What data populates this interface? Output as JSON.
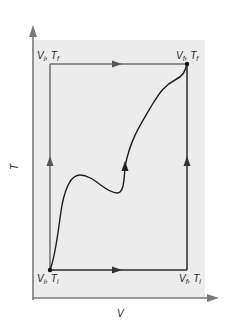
{
  "diagram": {
    "type": "thermodynamic-state-diagram",
    "axes": {
      "x_label": "V",
      "y_label": "T"
    },
    "colors": {
      "background": "#ffffff",
      "plot_fill": "#ececec",
      "axis": "#7a7a7a",
      "path": "#6e6e6e",
      "curve": "#1f1f1f",
      "arrow": "#555555",
      "point": "#111111"
    },
    "states": [
      {
        "id": "initial",
        "label_main": "V",
        "label_sub1": "i",
        "label_sep": ", T",
        "label_sub2": "i",
        "position": "bottom-left"
      },
      {
        "id": "top-left",
        "label_main": "V",
        "label_sub1": "i",
        "label_sep": ", T",
        "label_sub2": "f",
        "position": "top-left"
      },
      {
        "id": "final",
        "label_main": "V",
        "label_sub1": "f",
        "label_sep": ", T",
        "label_sub2": "f",
        "position": "top-right"
      },
      {
        "id": "bottom-right",
        "label_main": "V",
        "label_sub1": "f",
        "label_sep": ", T",
        "label_sub2": "i",
        "position": "bottom-right"
      }
    ],
    "paths": [
      {
        "name": "path-left-then-top",
        "description": "Constant V up from (Vi,Ti) to (Vi,Tf), then constant T right to (Vf,Tf)"
      },
      {
        "name": "path-bottom-then-right",
        "description": "Constant T right from (Vi,Ti) to (Vf,Ti), then constant V up to (Vf,Tf)"
      },
      {
        "name": "path-curve",
        "description": "Arbitrary curved path from (Vi,Ti) to (Vf,Tf)"
      }
    ]
  }
}
